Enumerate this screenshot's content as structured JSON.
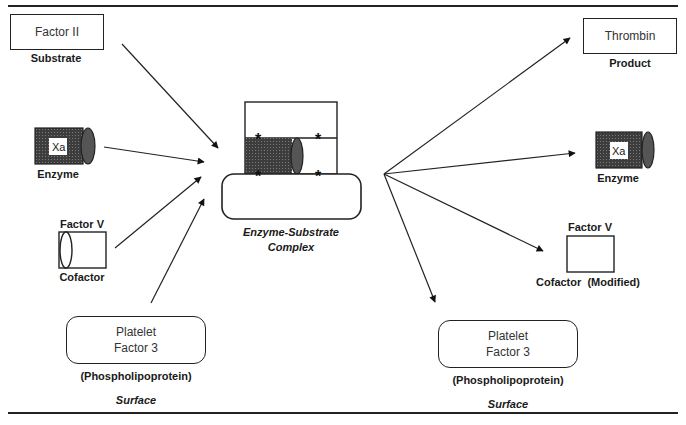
{
  "diagram": {
    "colors": {
      "line": "#222222",
      "enzyme_fill": "#4a4a4a",
      "background": "#ffffff"
    },
    "left": {
      "substrate": {
        "box_text": "Factor II",
        "role": "Substrate"
      },
      "enzyme": {
        "box_text": "Xa",
        "role": "Enzyme"
      },
      "cofactor": {
        "name": "Factor V",
        "role": "Cofactor"
      },
      "surface": {
        "box_text": "Platelet\nFactor 3",
        "subtitle": "(Phospholipoprotein)",
        "role": "Surface"
      }
    },
    "center": {
      "complex_label": "Enzyme-Substrate\nComplex"
    },
    "right": {
      "product": {
        "box_text": "Thrombin",
        "role": "Product"
      },
      "enzyme": {
        "box_text": "Xa",
        "role": "Enzyme"
      },
      "cofactor": {
        "name": "Factor V",
        "role": "Cofactor  (Modified)"
      },
      "surface": {
        "box_text": "Platelet\nFactor 3",
        "subtitle": "(Phospholipoprotein)",
        "role": "Surface"
      }
    }
  }
}
